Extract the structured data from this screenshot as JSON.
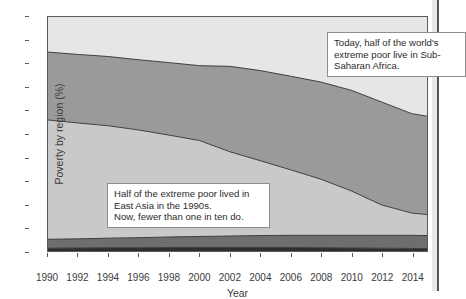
{
  "chart": {
    "ylabel": "Poverty by region (%)",
    "xlabel": "Year",
    "ytick_labels": [
      "0",
      "10",
      "20",
      "30",
      "40",
      "50",
      "60",
      "70",
      "80",
      "90",
      "100"
    ],
    "xtick_labels": [
      "1990",
      "1992",
      "1994",
      "1996",
      "1998",
      "2000",
      "2002",
      "2004",
      "2006",
      "2008",
      "2010",
      "2012",
      "2014"
    ]
  },
  "annotations": {
    "africa": "Today, half of the world's extreme poor live in Sub-Saharan Africa.",
    "east_asia": "Half of the extreme poor lived in East Asia in the 1990s.\nNow, fewer than one in ten do."
  },
  "colors": {
    "band_bottom": "#2e2e2e",
    "band_second": "#6e6e6e",
    "band_third": "#c9c9c9",
    "band_fourth": "#9a9a9a",
    "band_top": "#e6e6e6",
    "plot_background": "#ececec",
    "axis": "#5a5a5a",
    "text": "#3b3b3b"
  },
  "chart_data": {
    "type": "area",
    "title": "",
    "xlabel": "Year",
    "ylabel": "Poverty by region (%)",
    "xlim": [
      1990,
      2015
    ],
    "ylim": [
      0,
      100
    ],
    "grid": false,
    "legend": "none",
    "stacked": true,
    "x": [
      1990,
      1992,
      1994,
      1996,
      1998,
      2000,
      2002,
      2004,
      2006,
      2008,
      2010,
      2012,
      2014,
      2015
    ],
    "series": [
      {
        "name": "band-1",
        "color": "#2e2e2e",
        "values": [
          1.2,
          1.3,
          1.4,
          1.4,
          1.5,
          1.5,
          1.5,
          1.5,
          1.5,
          1.4,
          1.3,
          1.2,
          1.1,
          1.0
        ]
      },
      {
        "name": "band-2",
        "color": "#6e6e6e",
        "values": [
          3.8,
          3.9,
          4.1,
          4.3,
          4.5,
          4.7,
          4.9,
          5.1,
          5.2,
          5.3,
          5.4,
          5.5,
          5.6,
          5.6
        ]
      },
      {
        "name": "band-3",
        "color": "#c9c9c9",
        "values": [
          51.0,
          49.5,
          48.0,
          46.0,
          43.5,
          41.0,
          36.0,
          32.0,
          28.0,
          24.0,
          19.0,
          13.0,
          9.5,
          9.0
        ]
      },
      {
        "name": "band-4",
        "color": "#9a9a9a",
        "values": [
          29.0,
          29.3,
          29.6,
          30.0,
          31.0,
          32.0,
          36.5,
          38.5,
          40.0,
          41.5,
          43.0,
          44.0,
          42.5,
          42.0
        ]
      },
      {
        "name": "band-5",
        "color": "#e6e6e6",
        "values": [
          15.0,
          16.0,
          16.9,
          18.3,
          19.5,
          20.8,
          21.1,
          22.9,
          25.3,
          27.8,
          31.3,
          36.3,
          41.3,
          42.4
        ]
      }
    ],
    "cumulative_upper_bounds": {
      "band-1": [
        1.2,
        1.3,
        1.4,
        1.4,
        1.5,
        1.5,
        1.5,
        1.5,
        1.5,
        1.4,
        1.3,
        1.2,
        1.1,
        1.0
      ],
      "band-2": [
        5.0,
        5.2,
        5.5,
        5.7,
        6.0,
        6.2,
        6.4,
        6.6,
        6.7,
        6.7,
        6.7,
        6.7,
        6.7,
        6.6
      ],
      "band-3": [
        56.0,
        54.7,
        53.5,
        51.7,
        49.5,
        47.2,
        42.4,
        38.6,
        34.7,
        30.7,
        25.7,
        19.7,
        16.2,
        15.6
      ],
      "band-4": [
        85.0,
        84.0,
        83.1,
        81.7,
        80.5,
        79.2,
        78.9,
        77.1,
        74.7,
        72.2,
        68.7,
        63.7,
        58.7,
        57.6
      ],
      "band-5": [
        100,
        100,
        100,
        100,
        100,
        100,
        100,
        100,
        100,
        100,
        100,
        100,
        100,
        100
      ]
    }
  }
}
